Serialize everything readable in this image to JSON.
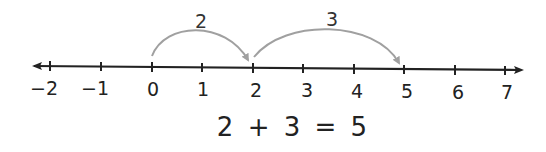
{
  "number_line": {
    "ticks": [
      "−2",
      "−1",
      "0",
      "1",
      "2",
      "3",
      "4",
      "5",
      "6",
      "7"
    ],
    "tick_values": [
      -2,
      -1,
      0,
      1,
      2,
      3,
      4,
      5,
      6,
      7
    ]
  },
  "jumps": [
    {
      "from": 0,
      "to": 2,
      "label": "2"
    },
    {
      "from": 2,
      "to": 5,
      "label": "3"
    }
  ],
  "equation": "2 + 3 = 5",
  "colors": {
    "line": "#222222",
    "arc": "#a0a0a0"
  }
}
